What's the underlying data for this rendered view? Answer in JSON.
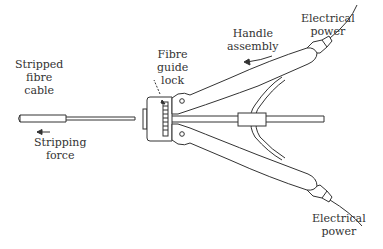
{
  "diagram": {
    "labels": {
      "stripped_cable": [
        "Stripped",
        "fibre",
        "cable"
      ],
      "stripping_force": [
        "Stripping",
        "force"
      ],
      "guide_lock": [
        "Fibre",
        "guide",
        "lock"
      ],
      "handle": [
        "Handle",
        "assembly"
      ],
      "power_top": [
        "Electrical",
        "power"
      ],
      "power_bottom": [
        "Electrical",
        "power"
      ]
    },
    "colors": {
      "line": "#333333",
      "background": "#ffffff"
    }
  }
}
